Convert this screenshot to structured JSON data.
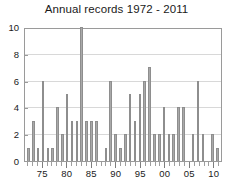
{
  "chart_data": {
    "type": "bar",
    "title": "Annual records 1972 - 2011",
    "xlabel": "",
    "ylabel": "",
    "ylim": [
      0,
      10
    ],
    "yticks": [
      0,
      2,
      4,
      6,
      8,
      10
    ],
    "grid": true,
    "legend": null,
    "categories": [
      "1972",
      "1973",
      "1974",
      "1975",
      "1976",
      "1977",
      "1978",
      "1979",
      "1980",
      "1981",
      "1982",
      "1983",
      "1984",
      "1985",
      "1986",
      "1987",
      "1988",
      "1989",
      "1990",
      "1991",
      "1992",
      "1993",
      "1994",
      "1995",
      "1996",
      "1997",
      "1998",
      "1999",
      "2000",
      "2001",
      "2002",
      "2003",
      "2004",
      "2005",
      "2006",
      "2007",
      "2008",
      "2009",
      "2010",
      "2011"
    ],
    "values": [
      1,
      3,
      1,
      6,
      1,
      1,
      4,
      2,
      5,
      3,
      3,
      10,
      3,
      3,
      3,
      0,
      1,
      6,
      2,
      1,
      2,
      5,
      3,
      5,
      6,
      7,
      2,
      2,
      4,
      2,
      2,
      4,
      4,
      0,
      2,
      6,
      2,
      0,
      2,
      1
    ],
    "xtick_labels": [
      {
        "label": "75",
        "category_index": 3
      },
      {
        "label": "80",
        "category_index": 8
      },
      {
        "label": "85",
        "category_index": 13
      },
      {
        "label": "90",
        "category_index": 18
      },
      {
        "label": "95",
        "category_index": 23
      },
      {
        "label": "00",
        "category_index": 28
      },
      {
        "label": "05",
        "category_index": 33
      },
      {
        "label": "10",
        "category_index": 38
      }
    ],
    "colors": {
      "bar_fill": "#a9a9a9",
      "bar_edge": "#8e8e8e",
      "grid": "#d8d8d8",
      "axis": "#9a9a9a",
      "text": "#1a1a1a",
      "background": "#ffffff"
    }
  }
}
